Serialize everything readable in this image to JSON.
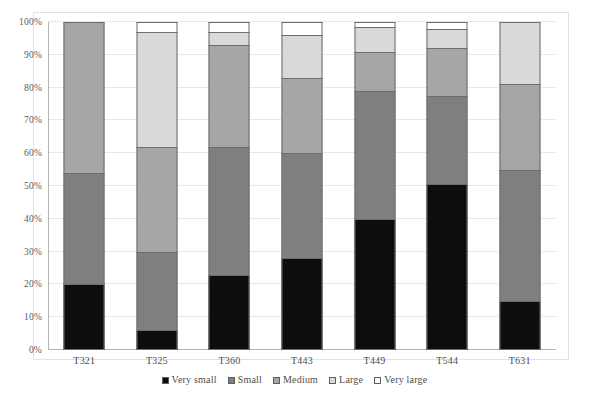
{
  "chart_data": {
    "type": "bar",
    "subtype": "stacked-percentage",
    "title": "",
    "subtitle": "",
    "xlabel": "",
    "ylabel": "",
    "categories": [
      "T321",
      "T325",
      "T360",
      "T443",
      "T449",
      "T544",
      "T631"
    ],
    "series": [
      {
        "name": "Very small",
        "color": "#0d0d0d",
        "values": [
          20,
          6,
          23,
          28,
          40,
          50.5,
          15
        ]
      },
      {
        "name": "Small",
        "color": "#7f7f7f",
        "values": [
          34,
          24,
          39,
          32,
          39,
          27,
          40
        ]
      },
      {
        "name": "Medium",
        "color": "#a6a6a6",
        "values": [
          46,
          32,
          31,
          23,
          12,
          14.5,
          26
        ]
      },
      {
        "name": "Large",
        "color": "#d9d9d9",
        "values": [
          0,
          35,
          4,
          13,
          7.5,
          6,
          19
        ]
      },
      {
        "name": "Very large",
        "color": "#ffffff",
        "values": [
          0,
          3,
          3,
          4,
          1.5,
          2,
          0
        ]
      }
    ],
    "ylim": [
      0,
      100
    ],
    "yticks": [
      0,
      10,
      20,
      30,
      40,
      50,
      60,
      70,
      80,
      90,
      100
    ],
    "ytick_labels": [
      "0%",
      "10%",
      "20%",
      "30%",
      "40%",
      "50%",
      "60%",
      "70%",
      "80%",
      "90%",
      "100%"
    ],
    "grid": true,
    "legend_position": "bottom",
    "legend_entries": [
      "Very small",
      "Small",
      "Medium",
      "Large",
      "Very large"
    ],
    "annotations": []
  },
  "style": {
    "bar_border": "#6d6d6d",
    "grid_color": "#e8e8e8",
    "axis_color": "#b4b4b4",
    "frame_color": "#e2e2e2",
    "text_color": "#4e4e4e",
    "background": "#ffffff"
  }
}
